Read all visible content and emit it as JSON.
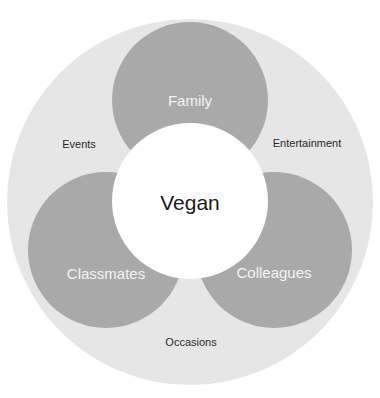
{
  "diagram": {
    "center": {
      "label": "Vegan"
    },
    "inner_circles": [
      {
        "label": "Family"
      },
      {
        "label": "Classmates"
      },
      {
        "label": "Colleagues"
      }
    ],
    "outer_labels": [
      {
        "label": "Events"
      },
      {
        "label": "Entertainment"
      },
      {
        "label": "Occasions"
      }
    ],
    "colors": {
      "outer_ring": "#e6e6e6",
      "inner_circle": "#a9a9a9",
      "center_circle": "#ffffff"
    }
  }
}
